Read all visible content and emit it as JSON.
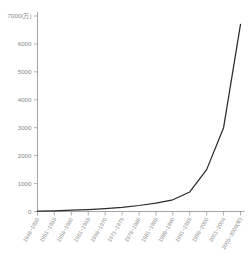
{
  "chart_data": {
    "type": "line",
    "title": "",
    "subtitle": "",
    "xlabel": "",
    "ylabel": "",
    "yunit_label": "7000(万)",
    "xunit_label": "(年)",
    "grid": false,
    "legend": false,
    "legend_position": "none",
    "ylim": [
      0,
      7000
    ],
    "ytick_labels": [
      "7000(万)",
      "6000",
      "5000",
      "4000",
      "3000",
      "2000",
      "1000",
      "0"
    ],
    "ytick_values": [
      7000,
      6000,
      5000,
      4000,
      3000,
      2000,
      1000,
      0
    ],
    "categories": [
      "1946~1950",
      "1951~1955",
      "1956~1960",
      "1961~1965",
      "1966~1970",
      "1971~1975",
      "1976~1980",
      "1981~1985",
      "1986~1990",
      "1991~1995",
      "1996~2000",
      "2001~2004",
      "2005~2009(年)"
    ],
    "series": [
      {
        "name": "累計",
        "color": "#2b2b2b",
        "values": [
          10,
          25,
          45,
          70,
          105,
          150,
          215,
          300,
          420,
          700,
          1500,
          3000,
          6700
        ]
      }
    ]
  },
  "axis_colors": {
    "axis": "#9a9a9a",
    "text": "#8a8a8a",
    "line": "#2b2b2b",
    "background": "#ffffff"
  }
}
